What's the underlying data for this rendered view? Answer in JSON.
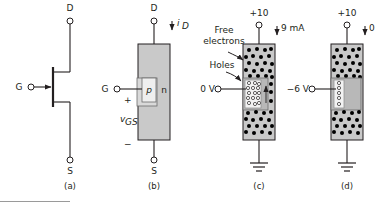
{
  "figure": {
    "background": "#ffffff",
    "line_color": "#231f20",
    "body_fill": "#c9c9c9",
    "depletion_fill": "#b5b5b5",
    "hole_fill": "#ffffff",
    "electron_fill": "#000000"
  },
  "panels": [
    {
      "id": "a",
      "caption": "(a)",
      "type": "schematic-symbol",
      "terminals": {
        "drain": "D",
        "gate": "G",
        "source": "S"
      }
    },
    {
      "id": "b",
      "caption": "(b)",
      "type": "structure",
      "terminals": {
        "drain": "D",
        "gate": "G",
        "source": "S"
      },
      "regions": {
        "p_region": "p",
        "n_region": "n"
      },
      "annotations": {
        "drain_current": "i",
        "drain_current_sub": "D",
        "gate_source_voltage": "v",
        "gate_source_voltage_sub": "GS",
        "plus_sign": "+",
        "minus_sign": "−"
      }
    },
    {
      "id": "c",
      "caption": "(c)",
      "type": "operation-conducting",
      "annotations": {
        "supply": "+10",
        "current": "9 mA",
        "gate_voltage": "0 V",
        "free_electrons_label_line1": "Free",
        "free_electrons_label_line2": "electrons",
        "holes_label": "Holes"
      }
    },
    {
      "id": "d",
      "caption": "(d)",
      "type": "operation-pinched-off",
      "annotations": {
        "supply": "+10",
        "current": "0",
        "gate_voltage": "−6 V"
      }
    }
  ]
}
